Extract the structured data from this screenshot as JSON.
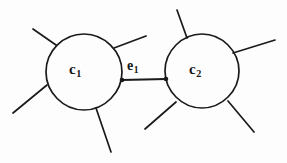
{
  "figure": {
    "type": "graph-diagram",
    "background_color": "#fdfdfd",
    "ink_color": "#1a1a1a"
  },
  "nodes": [
    {
      "id": "c1",
      "label_base": "c",
      "label_sub": "1",
      "center_x": 84,
      "center_y": 72,
      "radius": 38
    },
    {
      "id": "c2",
      "label_base": "c",
      "label_sub": "2",
      "center_x": 202,
      "center_y": 71,
      "radius": 37
    }
  ],
  "edges": [
    {
      "id": "e1",
      "label_base": "e",
      "label_sub": "1",
      "from": "c1",
      "to": "c2",
      "x1": 122,
      "y1": 80,
      "x2": 166,
      "y2": 79
    }
  ],
  "stubs": [
    {
      "name": "c1-upper-left",
      "x1": 56,
      "y1": 45,
      "x2": 33,
      "y2": 29
    },
    {
      "name": "c1-upper-right",
      "x1": 114,
      "y1": 48,
      "x2": 146,
      "y2": 36
    },
    {
      "name": "c1-left",
      "x1": 47,
      "y1": 85,
      "x2": 13,
      "y2": 113
    },
    {
      "name": "c1-bottom",
      "x1": 96,
      "y1": 108,
      "x2": 111,
      "y2": 152
    },
    {
      "name": "c2-top",
      "x1": 187,
      "y1": 38,
      "x2": 177,
      "y2": 10
    },
    {
      "name": "c2-upper-right",
      "x1": 233,
      "y1": 53,
      "x2": 275,
      "y2": 40
    },
    {
      "name": "c2-lower-left",
      "x1": 176,
      "y1": 102,
      "x2": 145,
      "y2": 129
    },
    {
      "name": "c2-lower-right",
      "x1": 228,
      "y1": 101,
      "x2": 254,
      "y2": 132
    }
  ]
}
